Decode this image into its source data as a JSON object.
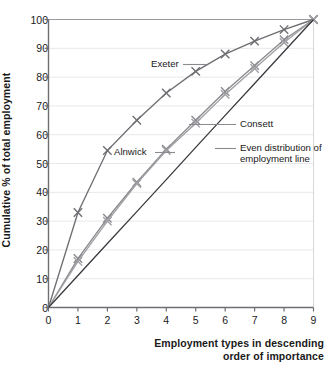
{
  "chart_data": {
    "type": "line",
    "title": "",
    "xlabel": "Employment types in descending order of importance",
    "ylabel": "Cumulative % of total employment",
    "x": [
      0,
      1,
      2,
      3,
      4,
      5,
      6,
      7,
      8,
      9
    ],
    "xlim": [
      0,
      9
    ],
    "ylim": [
      0,
      100
    ],
    "xticks": [
      "0",
      "1",
      "2",
      "3",
      "4",
      "5",
      "6",
      "7",
      "8",
      "9"
    ],
    "yticks": [
      "0",
      "10",
      "20",
      "30",
      "40",
      "50",
      "60",
      "70",
      "80",
      "90",
      "100"
    ],
    "grid": "horizontal",
    "legend": "inline-annotations",
    "marker": "x",
    "series": [
      {
        "name": "Exeter",
        "color": "#6e6e73",
        "values": [
          0,
          33,
          54.5,
          65,
          74.5,
          82,
          88,
          92.5,
          96.5,
          100
        ]
      },
      {
        "name": "Alnwick",
        "color": "#8a8a8f",
        "values": [
          0,
          17,
          31,
          43.5,
          55,
          65,
          75,
          84,
          93,
          100
        ]
      },
      {
        "name": "Consett",
        "color": "#a0a0a5",
        "values": [
          0,
          16,
          30,
          43,
          54.5,
          64,
          74,
          83,
          92,
          100
        ]
      },
      {
        "name": "Even distribution of employment line",
        "color": "#3a3a3f",
        "values": [
          0,
          11.1,
          22.2,
          33.3,
          44.4,
          55.6,
          66.7,
          77.8,
          88.9,
          100
        ]
      }
    ],
    "annotations": [
      {
        "text": "Exeter",
        "series": "Exeter"
      },
      {
        "text": "Alnwick",
        "series": "Alnwick"
      },
      {
        "text": "Consett",
        "series": "Consett"
      },
      {
        "text": "Even distribution of",
        "series": "Even distribution of employment line"
      },
      {
        "text": "employment line",
        "series": "Even distribution of employment line"
      }
    ]
  },
  "axis": {
    "y_title": "Cumulative % of total employment",
    "x_title_line1": "Employment types in descending",
    "x_title_line2": "order of importance"
  },
  "colors": {
    "background": "#ffffff",
    "axis": "#6e6e73",
    "grid": "#e8e8ea",
    "text": "#1a1a1a"
  }
}
